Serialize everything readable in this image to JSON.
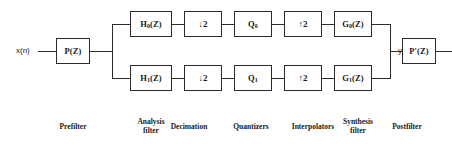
{
  "figure": {
    "line_color": "#2b2b2b",
    "background": "#ffffff"
  },
  "signals": {
    "input": "x(n)",
    "output": "y(n)"
  },
  "blocks": {
    "prefilter": {
      "label": "P(Z)"
    },
    "postfilter": {
      "label": "P'(Z)"
    },
    "analysis_top": {
      "label": "H",
      "sub": "0",
      "suffix": "(Z)"
    },
    "analysis_bottom": {
      "label": "H",
      "sub": "1",
      "suffix": "(Z)"
    },
    "decimator_top": {
      "label": "↓2"
    },
    "decimator_bottom": {
      "label": "↓2"
    },
    "quantizer_top": {
      "label": "Q",
      "sub": "0"
    },
    "quantizer_bottom": {
      "label": "Q",
      "sub": "1"
    },
    "interpolator_top": {
      "label": "↑2"
    },
    "interpolator_bottom": {
      "label": "↑2"
    },
    "synthesis_top": {
      "label": "G",
      "sub": "0",
      "suffix": "(Z)"
    },
    "synthesis_bottom": {
      "label": "G",
      "sub": "1",
      "suffix": "(Z)"
    }
  },
  "captions": [
    {
      "id": "prefilter",
      "text": "Prefilter"
    },
    {
      "id": "analysis-filter",
      "text": "Analysis\nfilter"
    },
    {
      "id": "decimation",
      "text": "Decimation"
    },
    {
      "id": "quantizers",
      "text": "Quantizers"
    },
    {
      "id": "interpolators",
      "text": "Interpolators"
    },
    {
      "id": "synthesis-filter",
      "text": "Synthesis\nfilter"
    },
    {
      "id": "postfilter",
      "text": "Postfilter"
    }
  ]
}
